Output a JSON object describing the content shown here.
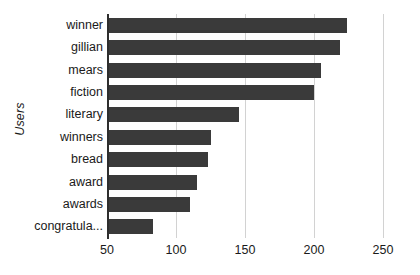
{
  "chart_data": {
    "type": "bar",
    "orientation": "horizontal",
    "title": "",
    "xlabel": "",
    "ylabel": "Users",
    "categories": [
      "winner",
      "gillian",
      "mears",
      "fiction",
      "literary",
      "winners",
      "bread",
      "award",
      "awards",
      "congratula..."
    ],
    "values": [
      224,
      219,
      205,
      200,
      146,
      125,
      123,
      115,
      110,
      83
    ],
    "xticks": [
      50,
      100,
      150,
      200,
      250
    ],
    "xlim": [
      50,
      250
    ],
    "grid": true,
    "legend": false,
    "bar_color": "#3a3a3a",
    "gridline_color": "#d2d2d2",
    "axis_color": "#2e2e2e",
    "background_color": "#ffffff"
  }
}
